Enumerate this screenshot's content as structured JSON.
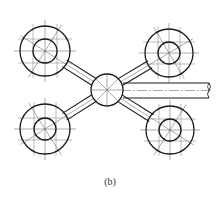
{
  "figure": {
    "caption": "(b)",
    "stroke_color": "#1a1a1a",
    "thin_color": "#555555",
    "hub": {
      "cx": 107,
      "cy": 90,
      "r": 16
    },
    "wheels": [
      {
        "name": "top-left",
        "cx": 45,
        "cy": 51,
        "outer_r": 25,
        "inner_r": 12
      },
      {
        "name": "top-right",
        "cx": 169,
        "cy": 53,
        "outer_r": 24,
        "inner_r": 11
      },
      {
        "name": "bottom-left",
        "cx": 45,
        "cy": 129,
        "outer_r": 25,
        "inner_r": 11
      },
      {
        "name": "bottom-right",
        "cx": 170,
        "cy": 130,
        "outer_r": 24,
        "inner_r": 11
      }
    ],
    "pipe": {
      "x_start": 123,
      "x_end": 209,
      "y_top": 83,
      "y_bottom": 98
    }
  }
}
